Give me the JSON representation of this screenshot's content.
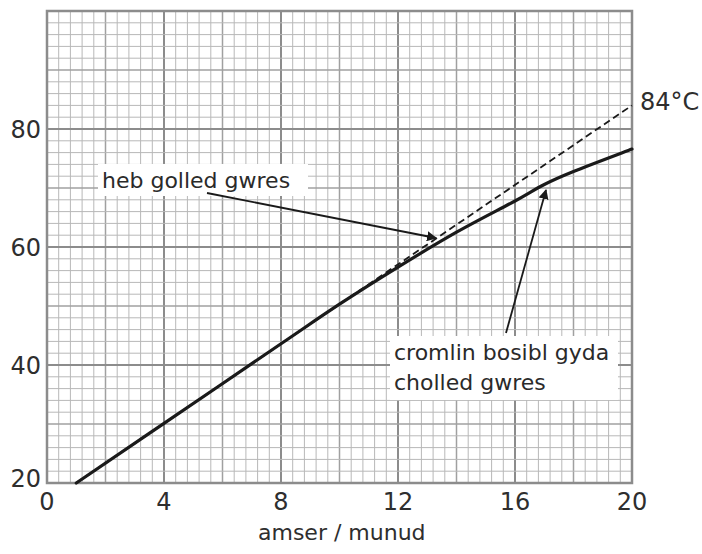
{
  "chart_data": {
    "type": "line",
    "title": "",
    "xlabel": "amser / munud",
    "ylabel": "",
    "xlim": [
      0,
      20
    ],
    "ylim": [
      20,
      100
    ],
    "x_ticks": [
      0,
      4,
      8,
      12,
      16,
      20
    ],
    "y_ticks": [
      20,
      40,
      60,
      80
    ],
    "grid": {
      "on": true,
      "minor_x": 0.4,
      "minor_y": 2,
      "mid_x": 2,
      "mid_y": 10,
      "major_x": 4,
      "major_y": 20
    },
    "series": [
      {
        "name": "heb golled gwres",
        "style": "dashed",
        "x": [
          1,
          20
        ],
        "y": [
          20,
          84
        ]
      },
      {
        "name": "cromlin bosibl gyda cholled gwres",
        "style": "solid",
        "x": [
          1,
          4,
          8,
          10,
          12,
          14,
          16,
          17,
          18,
          20
        ],
        "y": [
          20,
          30.1,
          43.6,
          50.3,
          56.6,
          62.5,
          67.8,
          70.6,
          72.8,
          76.6
        ]
      }
    ],
    "annotations": [
      {
        "text": "84°C",
        "x": 20,
        "y": 84
      },
      {
        "text": "heb golled gwres",
        "arrow_to": [
          13.4,
          61
        ]
      },
      {
        "text": "cromlin bosibl gyda cholled gwres",
        "arrow_to": [
          17.1,
          71
        ]
      }
    ]
  },
  "labels": {
    "x_axis": "amser / munud",
    "end_value": "84°C",
    "annotation_dashed": "heb golled gwres",
    "annotation_solid_line1": "cromlin bosibl gyda",
    "annotation_solid_line2": "cholled gwres",
    "x_ticks": [
      "0",
      "4",
      "8",
      "12",
      "16",
      "20"
    ],
    "y_ticks": [
      "20",
      "40",
      "60",
      "80"
    ]
  },
  "colors": {
    "grid_minor": "#b8b8b8",
    "grid_mid": "#a0a0a0",
    "grid_major": "#8c8c8c",
    "line": "#1a1a1a",
    "text": "#2e2e2e"
  }
}
